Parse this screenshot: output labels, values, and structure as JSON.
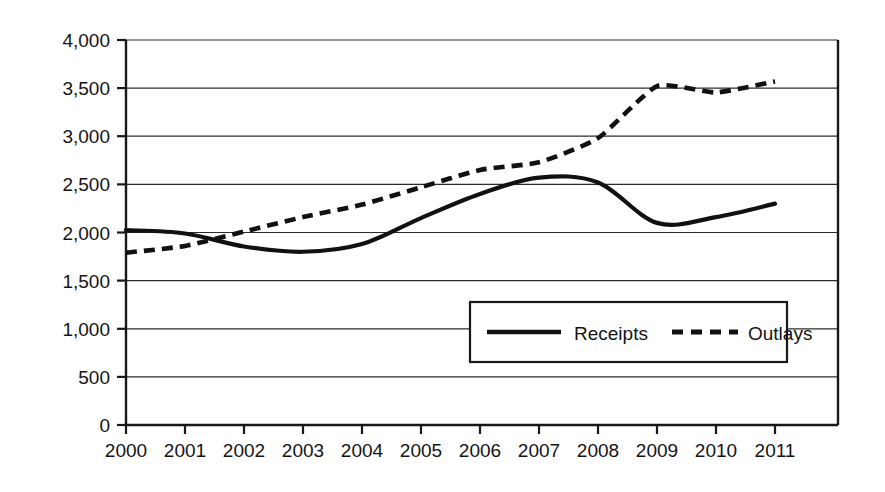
{
  "chart_data": {
    "type": "line",
    "title": "",
    "subtitle": "",
    "xlabel": "",
    "ylabel": "",
    "categories": [
      "2000",
      "2001",
      "2002",
      "2003",
      "2004",
      "2005",
      "2006",
      "2007",
      "2008",
      "2009",
      "2010",
      "2011"
    ],
    "x": [
      2000,
      2001,
      2002,
      2003,
      2004,
      2005,
      2006,
      2007,
      2008,
      2009,
      2010,
      2011
    ],
    "series": [
      {
        "name": "Receipts",
        "style": "solid",
        "color": "#111111",
        "values": [
          2025,
          1990,
          1855,
          1800,
          1880,
          2150,
          2400,
          2570,
          2520,
          2100,
          2160,
          2300
        ]
      },
      {
        "name": "Outlays",
        "style": "dashed",
        "color": "#111111",
        "values": [
          1790,
          1860,
          2010,
          2160,
          2290,
          2470,
          2650,
          2730,
          2980,
          3520,
          3455,
          3570
        ]
      }
    ],
    "ylim": [
      0,
      4000
    ],
    "xlim": [
      2000,
      2011
    ],
    "yticks": [
      0,
      500,
      1000,
      1500,
      2000,
      2500,
      3000,
      3500,
      4000
    ],
    "ytick_labels": [
      "0",
      "500",
      "1,000",
      "1,500",
      "2,000",
      "2,500",
      "3,000",
      "3,500",
      "4,000"
    ],
    "xtick_labels": [
      "2000",
      "2001",
      "2002",
      "2003",
      "2004",
      "2005",
      "2006",
      "2007",
      "2008",
      "2009",
      "2010",
      "2011"
    ],
    "grid": true,
    "grid_axis": "y",
    "legend_position": "inside-lower-center",
    "legend_entries": [
      {
        "label": "Receipts",
        "style": "solid"
      },
      {
        "label": "Outlays",
        "style": "dashed"
      }
    ]
  },
  "legend": {
    "receipts_label": "Receipts",
    "outlays_label": "Outlays"
  },
  "axis": {
    "y_labels": [
      "4,000",
      "3,500",
      "3,000",
      "2,500",
      "2,000",
      "1,500",
      "1,000",
      "500",
      "0"
    ],
    "x_labels": [
      "2000",
      "2001",
      "2002",
      "2003",
      "2004",
      "2005",
      "2006",
      "2007",
      "2008",
      "2009",
      "2010",
      "2011"
    ]
  },
  "colors": {
    "background": "#ffffff",
    "ink": "#111111",
    "gridline": "#2b2b2b"
  }
}
